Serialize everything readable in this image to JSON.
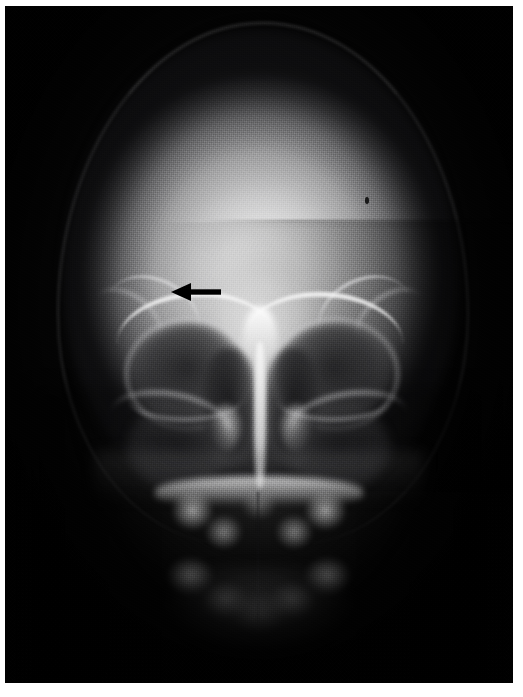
{
  "image": {
    "kind": "radiograph",
    "modality": "X-ray",
    "view": "PA / Caldwell skull projection",
    "subject": "skull",
    "orientation": "frontal",
    "background_color": "#ffffff",
    "film_color": "#050505",
    "highlight_color": "#f0f0f0",
    "annotation_color": "#000000",
    "width": 523,
    "height": 697,
    "film": {
      "left": 5,
      "top": 6,
      "width": 508,
      "height": 677
    }
  },
  "annotations": [
    {
      "name": "pointer-arrow",
      "shape": "arrow",
      "direction": "left",
      "color": "#000000",
      "tip_x": 172,
      "tip_y": 292,
      "tail_x": 219,
      "tail_y": 292,
      "label": "",
      "target_region": "left frontal sinus / supraorbital region"
    }
  ],
  "anatomy": [
    {
      "name": "cranial-vault",
      "appearance": "bright"
    },
    {
      "name": "frontal-bone",
      "appearance": "bright"
    },
    {
      "name": "supraorbital-ridge-left",
      "appearance": "bright-arc"
    },
    {
      "name": "supraorbital-ridge-right",
      "appearance": "bright-arc"
    },
    {
      "name": "orbit-left",
      "appearance": "dark-cavity"
    },
    {
      "name": "orbit-right",
      "appearance": "dark-cavity"
    },
    {
      "name": "nasal-septum",
      "appearance": "bright-midline"
    },
    {
      "name": "nasal-cavity-left",
      "appearance": "dark-cavity"
    },
    {
      "name": "nasal-cavity-right",
      "appearance": "dark-cavity"
    },
    {
      "name": "inferior-turbinate-left",
      "appearance": "bright"
    },
    {
      "name": "inferior-turbinate-right",
      "appearance": "bright"
    },
    {
      "name": "maxillary-sinus-left",
      "appearance": "dark-aircell"
    },
    {
      "name": "maxillary-sinus-right",
      "appearance": "dark-aircell"
    },
    {
      "name": "zygomatic-arch-left",
      "appearance": "bright-strut"
    },
    {
      "name": "zygomatic-arch-right",
      "appearance": "bright-strut"
    },
    {
      "name": "hard-palate",
      "appearance": "bright-band"
    },
    {
      "name": "maxillary-teeth",
      "appearance": "bright-arch"
    },
    {
      "name": "mandibular-teeth",
      "appearance": "bright-arch"
    },
    {
      "name": "mandible",
      "appearance": "soft-shadow"
    }
  ],
  "artifacts": [
    {
      "name": "collimation-density-step",
      "appearance": "horizontal-edge-upper-right"
    },
    {
      "name": "film-speck",
      "appearance": "small-dark-dot"
    },
    {
      "name": "halftone-screen",
      "appearance": "print-dot-texture"
    }
  ]
}
